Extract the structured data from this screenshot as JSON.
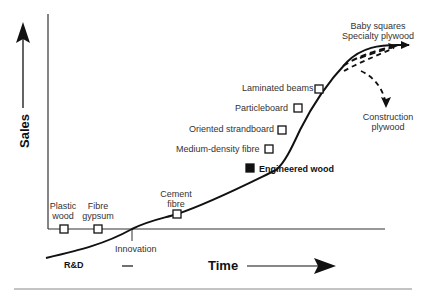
{
  "diagram": {
    "type": "product-life-cycle",
    "axes": {
      "y_label": "Sales",
      "x_label": "Time"
    },
    "phases": {
      "pre": "R&D",
      "milestone": "Innovation"
    },
    "products": [
      {
        "label_line1": "Plastic",
        "label_line2": "wood",
        "marker": "open-square"
      },
      {
        "label_line1": "Fibre",
        "label_line2": "gypsum",
        "marker": "open-square"
      },
      {
        "label_line1": "Cement",
        "label_line2": "fibre",
        "marker": "open-square"
      },
      {
        "label": "Engineered wood",
        "marker": "filled-square",
        "emphasis": "bold"
      },
      {
        "label": "Medium-density fibre",
        "marker": "open-square"
      },
      {
        "label": "Oriented strandboard",
        "marker": "open-square"
      },
      {
        "label": "Particleboard",
        "marker": "open-square"
      },
      {
        "label": "Laminated beams",
        "marker": "open-square"
      }
    ],
    "futures": {
      "up": {
        "line1": "Baby squares",
        "line2": "Specialty plywood"
      },
      "down": {
        "line1": "Construction",
        "line2": "plywood"
      }
    },
    "colors": {
      "line": "#111111",
      "axis": "#333333",
      "text": "#333333"
    }
  }
}
